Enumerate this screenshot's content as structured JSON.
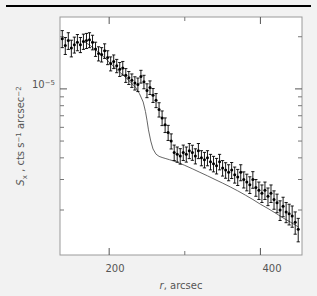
{
  "figure": {
    "name": "x-ray-surface-brightness-profile",
    "background_color": "#f2f2f2",
    "plot_background_color": "#ffffff",
    "frame_color": "#9a9a9a",
    "text_color": "#555555",
    "data_color": "#000000",
    "model_curve_color": "#555555",
    "top_rule": true
  },
  "axes": {
    "x": {
      "label_parts": {
        "symbol": "r",
        "rest": ", arcsec"
      },
      "label_full": "r, arcsec",
      "scale": "linear",
      "range": [
        135,
        455
      ],
      "major_ticks": [
        200,
        400
      ],
      "major_tick_labels": [
        "200",
        "400"
      ],
      "minor_ticks": [
        300
      ]
    },
    "y": {
      "label_parts": {
        "sym": "S",
        "sub": "x",
        "mid": " , cts s",
        "exp1": "−1",
        "mid2": " arcsec",
        "exp2": "−2"
      },
      "label_full": "S_x , cts s^-1 arcsec^-2",
      "scale": "log",
      "range": [
        1.1e-06,
        2.6e-05
      ],
      "major_ticks": [
        1e-05
      ],
      "major_tick_labels": [
        "10−5"
      ],
      "major_tick_mantissa": "10",
      "major_tick_exponent": "−5",
      "minor_ticks": [
        2e-06,
        3e-06,
        4e-06,
        5e-06,
        6e-06,
        7e-06,
        8e-06,
        9e-06,
        2e-05
      ]
    }
  },
  "chart_data": {
    "type": "scatter",
    "title": "",
    "subtitle": "",
    "xlabel": "r, arcsec",
    "ylabel": "S_x , cts s^-1 arcsec^-2",
    "xlim": [
      135,
      455
    ],
    "ylim": [
      1.1e-06,
      2.6e-05
    ],
    "xscale": "linear",
    "yscale": "log",
    "grid": false,
    "legend": false,
    "legend_position": "none",
    "annotations": [],
    "series": [
      {
        "name": "observed surface brightness",
        "type": "scatter",
        "marker": "filled-circle-with-yerr",
        "color": "#000000",
        "x": [
          138,
          142,
          146,
          150,
          154,
          158,
          162,
          166,
          170,
          174,
          178,
          182,
          186,
          190,
          194,
          198,
          202,
          206,
          210,
          214,
          218,
          222,
          226,
          230,
          234,
          238,
          242,
          246,
          250,
          254,
          258,
          262,
          266,
          270,
          274,
          278,
          282,
          286,
          290,
          294,
          298,
          302,
          306,
          310,
          314,
          318,
          322,
          326,
          330,
          334,
          338,
          342,
          346,
          350,
          354,
          358,
          362,
          366,
          370,
          374,
          378,
          382,
          386,
          390,
          394,
          398,
          402,
          406,
          410,
          414,
          418,
          422,
          426,
          430,
          434,
          438,
          442,
          446,
          450
        ],
        "y": [
          1.95e-05,
          1.78e-05,
          1.9e-05,
          1.72e-05,
          1.8e-05,
          1.86e-05,
          1.8e-05,
          1.88e-05,
          1.9e-05,
          1.92e-05,
          1.86e-05,
          1.7e-05,
          1.6e-05,
          1.58e-05,
          1.66e-05,
          1.52e-05,
          1.4e-05,
          1.44e-05,
          1.36e-05,
          1.3e-05,
          1.32e-05,
          1.2e-05,
          1.16e-05,
          1.12e-05,
          1.08e-05,
          1.06e-05,
          1.18e-05,
          1.1e-05,
          9.8e-06,
          1.02e-05,
          9.2e-06,
          8.6e-06,
          7.6e-06,
          6.8e-06,
          6.2e-06,
          5.6e-06,
          5e-06,
          4.3e-06,
          4.2e-06,
          4.1e-06,
          4.3e-06,
          4.2e-06,
          4.4e-06,
          4.3e-06,
          4.1e-06,
          4.4e-06,
          4e-06,
          3.9e-06,
          4e-06,
          3.8e-06,
          3.7e-06,
          3.6e-06,
          3.8e-06,
          3.5e-06,
          3.4e-06,
          3.3e-06,
          3.4e-06,
          3.2e-06,
          3.1e-06,
          3.3e-06,
          3e-06,
          2.9e-06,
          2.8e-06,
          3e-06,
          2.7e-06,
          2.6e-06,
          2.5e-06,
          2.6e-06,
          2.4e-06,
          2.5e-06,
          2.3e-06,
          2.2e-06,
          2e-06,
          2.1e-06,
          1.95e-06,
          1.9e-06,
          1.85e-06,
          1.7e-06,
          1.55e-06
        ],
        "yerr": [
          2.2e-06,
          2e-06,
          2.1e-06,
          1.9e-06,
          1.9e-06,
          2e-06,
          1.8e-06,
          1.9e-06,
          1.9e-06,
          1.9e-06,
          1.8e-06,
          1.6e-06,
          1.5e-06,
          1.5e-06,
          1.6e-06,
          1.4e-06,
          1.3e-06,
          1.3e-06,
          1.2e-06,
          1.2e-06,
          1.2e-06,
          1.1e-06,
          1e-06,
          1e-06,
          9.5e-07,
          9.5e-07,
          1e-06,
          9.8e-07,
          9e-07,
          9.2e-07,
          8.5e-07,
          8e-07,
          7.2e-07,
          6.6e-07,
          6e-07,
          5.6e-07,
          5e-07,
          4.4e-07,
          4.2e-07,
          4.2e-07,
          4.4e-07,
          4.2e-07,
          4.4e-07,
          4.3e-07,
          4.1e-07,
          4.4e-07,
          4e-07,
          4e-07,
          4e-07,
          3.9e-07,
          3.8e-07,
          3.7e-07,
          3.9e-07,
          3.6e-07,
          3.5e-07,
          3.5e-07,
          3.6e-07,
          3.4e-07,
          3.3e-07,
          3.5e-07,
          3.2e-07,
          3.2e-07,
          3.1e-07,
          3.3e-07,
          3e-07,
          3e-07,
          2.9e-07,
          3e-07,
          2.8e-07,
          2.9e-07,
          2.8e-07,
          2.7e-07,
          2.6e-07,
          2.7e-07,
          2.6e-07,
          2.6e-07,
          2.6e-07,
          2.5e-07,
          2.4e-07
        ]
      },
      {
        "name": "best-fit model",
        "type": "line",
        "color": "#555555",
        "x": [
          165,
          175,
          185,
          195,
          205,
          215,
          225,
          235,
          240,
          245,
          248,
          250,
          252,
          255,
          258,
          262,
          266,
          270,
          275,
          280,
          285,
          292,
          300,
          310,
          320,
          330,
          340,
          350,
          360,
          370,
          380,
          390,
          400,
          410,
          420,
          430,
          440,
          450
        ],
        "y": [
          1.9e-05,
          1.78e-05,
          1.64e-05,
          1.5e-05,
          1.36e-05,
          1.24e-05,
          1.13e-05,
          1.02e-05,
          9.4e-06,
          8.4e-06,
          7.4e-06,
          6.6e-06,
          5.8e-06,
          5e-06,
          4.5e-06,
          4.2e-06,
          4.08e-06,
          4.02e-06,
          3.96e-06,
          3.9e-06,
          3.84e-06,
          3.74e-06,
          3.62e-06,
          3.46e-06,
          3.3e-06,
          3.15e-06,
          3e-06,
          2.86e-06,
          2.72e-06,
          2.58e-06,
          2.44e-06,
          2.3e-06,
          2.16e-06,
          2.04e-06,
          1.92e-06,
          1.8e-06,
          1.7e-06,
          1.6e-06
        ]
      }
    ]
  }
}
